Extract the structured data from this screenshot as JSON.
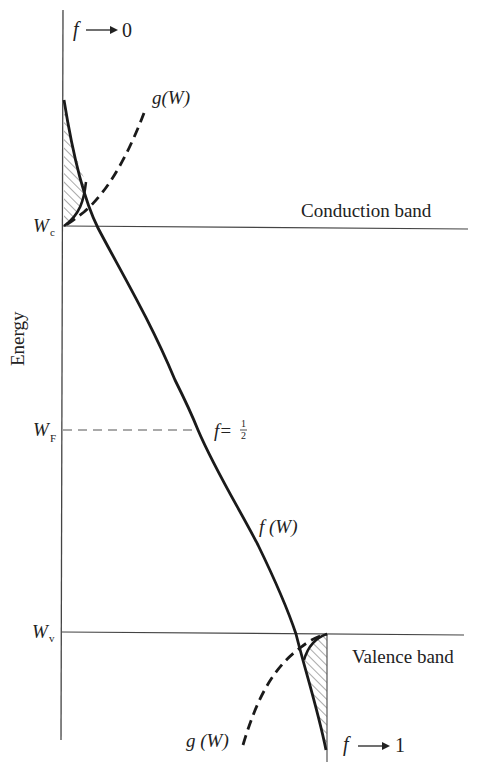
{
  "diagram": {
    "type": "band-diagram",
    "y_axis_label": "Energy",
    "levels": {
      "conduction_edge": {
        "symbol": "W",
        "subscript": "c",
        "band_label": "Conduction band"
      },
      "fermi_level": {
        "symbol": "W",
        "subscript": "F"
      },
      "valence_edge": {
        "symbol": "W",
        "subscript": "v",
        "band_label": "Valence band"
      }
    },
    "annotations": {
      "top_limit": {
        "f": "f",
        "arrow": "⟶",
        "value": "0"
      },
      "bottom_limit": {
        "f": "f",
        "arrow": "⟶",
        "value": "1"
      },
      "half_point": {
        "text": "f=",
        "num": "1",
        "den": "2"
      },
      "fermi_function": "f (W)",
      "dos_upper": "g(W)",
      "dos_lower": "g (W)"
    },
    "colors": {
      "line": "#1a1a1a",
      "thin_line": "#444444",
      "hatch": "#555555",
      "background": "#ffffff"
    }
  }
}
